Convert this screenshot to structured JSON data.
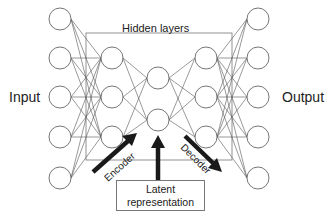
{
  "labels": {
    "input": "Input",
    "output": "Output",
    "hidden_layers": "Hidden layers",
    "encoder": "Encoder",
    "decoder": "Decoder",
    "latent_line1": "Latent",
    "latent_line2": "representation"
  },
  "network": {
    "layers": [
      {
        "name": "input",
        "x": 60,
        "nodes": [
          19,
          58,
          97,
          137,
          178
        ]
      },
      {
        "name": "hidden1",
        "x": 112,
        "nodes": [
          58,
          97,
          137
        ]
      },
      {
        "name": "latent",
        "x": 158,
        "nodes": [
          78,
          120
        ]
      },
      {
        "name": "hidden3",
        "x": 206,
        "nodes": [
          58,
          97,
          137
        ]
      },
      {
        "name": "output",
        "x": 258,
        "nodes": [
          19,
          58,
          97,
          137,
          178
        ]
      }
    ],
    "node_radius": 11,
    "hidden_box": {
      "x": 86,
      "y": 33,
      "w": 146,
      "h": 127
    }
  },
  "colors": {
    "line": "#555555",
    "node_stroke": "#666666",
    "arrow": "#1a1a1a"
  }
}
